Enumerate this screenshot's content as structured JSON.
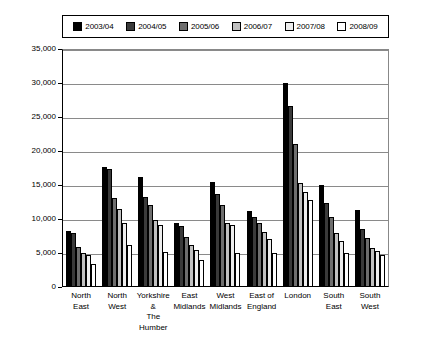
{
  "legend": {
    "items": [
      {
        "label": "2003/04",
        "color": "#000000"
      },
      {
        "label": "2004/05",
        "color": "#3a3a3a"
      },
      {
        "label": "2005/06",
        "color": "#6e6e6e"
      },
      {
        "label": "2006/07",
        "color": "#c0c0c0"
      },
      {
        "label": "2007/08",
        "color": "#ededed"
      },
      {
        "label": "2008/09",
        "color": "#ffffff"
      }
    ]
  },
  "axis": {
    "yticks": [
      "35,000",
      "30,000",
      "25,000",
      "20,000",
      "15,000",
      "10,000",
      "5,000",
      "0"
    ]
  },
  "chart_data": {
    "type": "bar",
    "title": "",
    "xlabel": "",
    "ylabel": "",
    "ylim": [
      0,
      35000
    ],
    "ytick_values": [
      0,
      5000,
      10000,
      15000,
      20000,
      25000,
      30000,
      35000
    ],
    "grid": true,
    "legend_position": "top",
    "categories": [
      "North\nEast",
      "North\nWest",
      "Yorkshire\n&\nThe Humber",
      "East\nMidlands",
      "West\nMidlands",
      "East of\nEngland",
      "London",
      "South\nEast",
      "South\nWest"
    ],
    "series": [
      {
        "name": "2003/04",
        "color": "#000000",
        "values": [
          8200,
          17700,
          16200,
          9400,
          15500,
          11200,
          30000,
          15000,
          11300
        ]
      },
      {
        "name": "2004/05",
        "color": "#3a3a3a",
        "values": [
          7900,
          17400,
          13300,
          8900,
          13700,
          10300,
          26600,
          12400,
          8600
        ]
      },
      {
        "name": "2005/06",
        "color": "#6e6e6e",
        "values": [
          5900,
          13100,
          12000,
          7400,
          12000,
          9400,
          21000,
          10300,
          7200
        ]
      },
      {
        "name": "2006/07",
        "color": "#c0c0c0",
        "values": [
          5000,
          11500,
          9900,
          6200,
          9400,
          8100,
          15300,
          8000,
          5700
        ]
      },
      {
        "name": "2007/08",
        "color": "#ededed",
        "values": [
          4700,
          9400,
          9100,
          5500,
          9100,
          7100,
          14000,
          6700,
          5300
        ]
      },
      {
        "name": "2008/09",
        "color": "#ffffff",
        "values": [
          3400,
          6200,
          5100,
          4000,
          5000,
          5000,
          12800,
          5000,
          4700
        ]
      }
    ]
  }
}
